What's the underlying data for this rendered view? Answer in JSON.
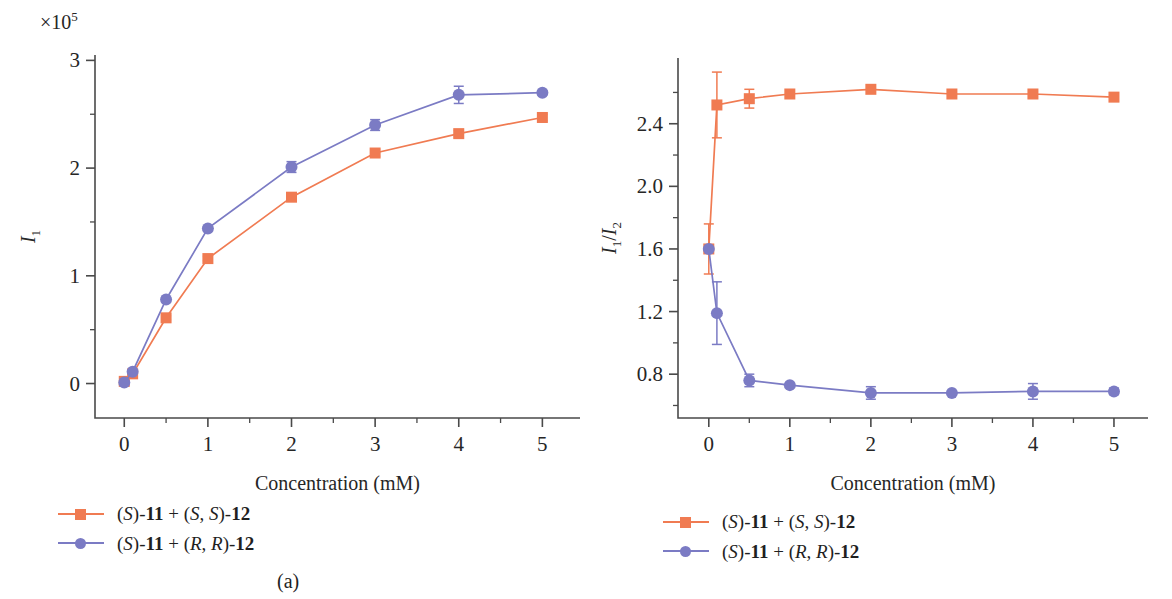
{
  "figure": {
    "subcaption_a": "(a)",
    "subcaption_b": "(b)"
  },
  "legend": {
    "series1_label": "(S)-11 + (S, S)-12",
    "series2_label": "(S)-11 + (R, R)-12",
    "series1_color": "#F07B52",
    "series2_color": "#7B7BC4"
  },
  "chart_data": [
    {
      "panel": "(a)",
      "type": "line",
      "title": "",
      "xlabel": "Concentration (mM)",
      "ylabel": "I₁",
      "y_exponent_label": "×10⁵",
      "xlim": [
        -0.35,
        5.45
      ],
      "ylim": [
        -0.32,
        3.05
      ],
      "xticks": [
        0,
        1,
        2,
        3,
        4,
        5
      ],
      "xtick_labels": [
        "0",
        "1",
        "2",
        "3",
        "4",
        "5"
      ],
      "yticks": [
        0,
        1,
        2,
        3
      ],
      "ytick_labels": [
        "0",
        "1",
        "2",
        "3"
      ],
      "yticks_minor": [
        0.5,
        1.5,
        2.5
      ],
      "grid": false,
      "legend_position": "below-left",
      "series": [
        {
          "name": "(S)-11 + (S, S)-12",
          "color": "#F07B52",
          "marker": "square",
          "x": [
            0,
            0.1,
            0.5,
            1,
            2,
            3,
            4,
            5
          ],
          "values": [
            0.02,
            0.09,
            0.61,
            1.16,
            1.73,
            2.14,
            2.32,
            2.47
          ],
          "yerr": [
            0.01,
            0.01,
            0.02,
            0.02,
            0.03,
            0.03,
            0.03,
            0.03
          ]
        },
        {
          "name": "(S)-11 + (R, R)-12",
          "color": "#7B7BC4",
          "marker": "circle",
          "x": [
            0,
            0.1,
            0.5,
            1,
            2,
            3,
            4,
            5
          ],
          "values": [
            0.01,
            0.11,
            0.78,
            1.44,
            2.01,
            2.4,
            2.68,
            2.7
          ],
          "yerr": [
            0.01,
            0.01,
            0.02,
            0.02,
            0.05,
            0.05,
            0.08,
            0.02
          ]
        }
      ]
    },
    {
      "panel": "(b)",
      "type": "line",
      "title": "",
      "xlabel": "Concentration (mM)",
      "ylabel": "I₁/I₂",
      "xlim": [
        -0.38,
        5.42
      ],
      "ylim": [
        0.52,
        2.82
      ],
      "xticks": [
        0,
        1,
        2,
        3,
        4,
        5
      ],
      "xtick_labels": [
        "0",
        "1",
        "2",
        "3",
        "4",
        "5"
      ],
      "yticks": [
        0.8,
        1.2,
        1.6,
        2.0,
        2.4
      ],
      "ytick_labels": [
        "0.8",
        "1.2",
        "1.6",
        "2.0",
        "2.4"
      ],
      "yticks_minor": [
        0.6,
        1.0,
        1.4,
        1.8,
        2.2,
        2.6
      ],
      "grid": false,
      "legend_position": "below-left",
      "series": [
        {
          "name": "(S)-11 + (S, S)-12",
          "color": "#F07B52",
          "marker": "square",
          "x": [
            0,
            0.1,
            0.5,
            1,
            2,
            3,
            4,
            5
          ],
          "values": [
            1.6,
            2.52,
            2.56,
            2.59,
            2.62,
            2.59,
            2.59,
            2.57
          ],
          "yerr": [
            0.16,
            0.21,
            0.06,
            0.0,
            0.0,
            0.0,
            0.0,
            0.0
          ]
        },
        {
          "name": "(S)-11 + (R, R)-12",
          "color": "#7B7BC4",
          "marker": "circle",
          "x": [
            0,
            0.1,
            0.5,
            1,
            2,
            3,
            4,
            5
          ],
          "values": [
            1.6,
            1.19,
            0.76,
            0.73,
            0.68,
            0.68,
            0.69,
            0.69
          ],
          "yerr": [
            0.0,
            0.2,
            0.04,
            0.0,
            0.04,
            0.0,
            0.05,
            0.02
          ]
        }
      ]
    }
  ]
}
